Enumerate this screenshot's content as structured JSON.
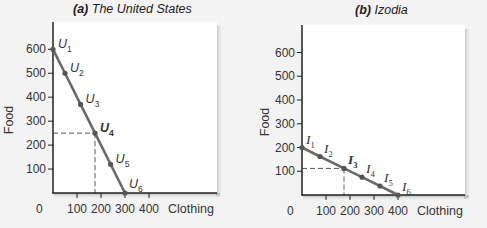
{
  "colors": {
    "background": "#f3f3f3",
    "plot_bg": "#ffffff",
    "axis": "#222222",
    "line": "#6a6a6a",
    "dashed": "#555555",
    "text": "#333333"
  },
  "chart_data": [
    {
      "type": "line",
      "panel": "a",
      "title_prefix": "(a)",
      "title": "The United States",
      "xlabel": "Clothing",
      "ylabel": "Food",
      "x_origin_label": "0",
      "xticks": [
        100,
        200,
        300,
        400
      ],
      "yticks": [
        100,
        200,
        300,
        400,
        500,
        600
      ],
      "xlim": [
        0,
        600
      ],
      "ylim": [
        0,
        700
      ],
      "grid": false,
      "series": [
        {
          "name": "US production possibilities",
          "points": [
            {
              "label": "U",
              "sub": "1",
              "x": 0,
              "y": 600,
              "bold": false
            },
            {
              "label": "U",
              "sub": "2",
              "x": 50,
              "y": 500,
              "bold": false
            },
            {
              "label": "U",
              "sub": "3",
              "x": 115,
              "y": 370,
              "bold": false
            },
            {
              "label": "U",
              "sub": "4",
              "x": 175,
              "y": 250,
              "bold": true
            },
            {
              "label": "U",
              "sub": "5",
              "x": 240,
              "y": 120,
              "bold": false
            },
            {
              "label": "U",
              "sub": "6",
              "x": 300,
              "y": 0,
              "bold": false
            }
          ]
        }
      ],
      "highlight": {
        "x": 175,
        "y": 250,
        "dashed_guides": true
      }
    },
    {
      "type": "line",
      "panel": "b",
      "title_prefix": "(b)",
      "title": "Izodia",
      "xlabel": "Clothing",
      "ylabel": "Food",
      "x_origin_label": "0",
      "xticks": [
        100,
        200,
        300,
        400
      ],
      "yticks": [
        100,
        200,
        300,
        400,
        500,
        600
      ],
      "xlim": [
        0,
        600
      ],
      "ylim": [
        0,
        700
      ],
      "grid": false,
      "series": [
        {
          "name": "Izodia production possibilities",
          "points": [
            {
              "label": "I",
              "sub": "1",
              "x": 0,
              "y": 200,
              "bold": false
            },
            {
              "label": "I",
              "sub": "2",
              "x": 75,
              "y": 162,
              "bold": false
            },
            {
              "label": "I",
              "sub": "3",
              "x": 175,
              "y": 112,
              "bold": true
            },
            {
              "label": "I",
              "sub": "4",
              "x": 250,
              "y": 75,
              "bold": false
            },
            {
              "label": "I",
              "sub": "5",
              "x": 325,
              "y": 38,
              "bold": false
            },
            {
              "label": "I",
              "sub": "6",
              "x": 400,
              "y": 0,
              "bold": false
            }
          ]
        }
      ],
      "highlight": {
        "x": 175,
        "y": 112,
        "dashed_guides": true
      }
    }
  ]
}
